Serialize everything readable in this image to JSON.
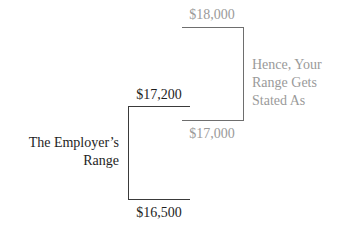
{
  "diagram": {
    "your_range": {
      "top_value": "$18,000",
      "bottom_value": "$17,000",
      "caption_lines": [
        "Hence, Your",
        "Range Gets",
        "Stated As"
      ],
      "color": "#9a9a9a"
    },
    "employer_range": {
      "top_value": "$17,200",
      "bottom_value": "$16,500",
      "caption_lines": [
        "The Employer’s",
        "Range"
      ],
      "color": "#1e1e1e"
    }
  }
}
